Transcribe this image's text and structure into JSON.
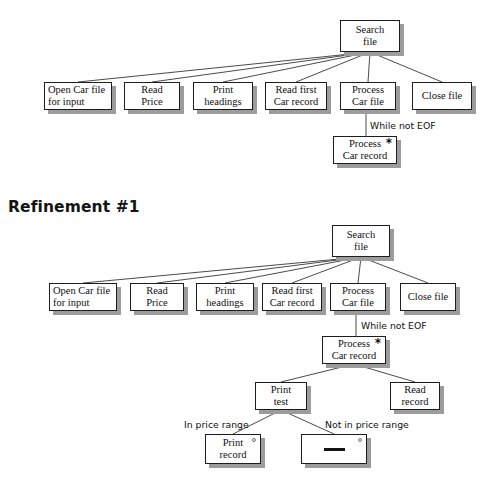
{
  "page": {
    "background": "#ffffff",
    "box_fill": "#ffffff",
    "box_border": "#1d1d1d",
    "shadow_color": "#9c9c9c",
    "line_color": "#2a2a2a"
  },
  "headings": [
    {
      "text": "Refinement #1",
      "x": 8,
      "y": 198
    }
  ],
  "diagram_top": {
    "name": "initial-structure-chart",
    "root": {
      "label_lines": [
        "Search",
        "file"
      ],
      "x": 340,
      "y": 20,
      "w": 60,
      "h": 32
    },
    "children": [
      {
        "label_lines": [
          "Open Car file",
          "for input"
        ],
        "x": 44,
        "y": 82,
        "w": 68,
        "h": 28,
        "align": "left"
      },
      {
        "label_lines": [
          "Read",
          "Price"
        ],
        "x": 124,
        "y": 82,
        "w": 56,
        "h": 28,
        "align": "center"
      },
      {
        "label_lines": [
          "Print",
          "headings"
        ],
        "x": 193,
        "y": 82,
        "w": 60,
        "h": 28,
        "align": "center"
      },
      {
        "label_lines": [
          "Read first",
          "Car record"
        ],
        "x": 265,
        "y": 82,
        "w": 62,
        "h": 28,
        "align": "center"
      },
      {
        "label_lines": [
          "Process",
          "Car file"
        ],
        "x": 340,
        "y": 82,
        "w": 56,
        "h": 28,
        "align": "center"
      },
      {
        "label_lines": [
          "Close file"
        ],
        "x": 412,
        "y": 82,
        "w": 60,
        "h": 28,
        "align": "center"
      }
    ],
    "loop_label": {
      "text": "While not EOF",
      "x": 370,
      "y": 120
    },
    "iteration_node": {
      "label_lines": [
        "Process",
        "Car record"
      ],
      "x": 333,
      "y": 136,
      "w": 64,
      "h": 28,
      "iteration_mark": "*"
    }
  },
  "diagram_bottom": {
    "name": "refinement-1-structure-chart",
    "root": {
      "label_lines": [
        "Search",
        "file"
      ],
      "x": 332,
      "y": 225,
      "w": 58,
      "h": 32
    },
    "children": [
      {
        "label_lines": [
          "Open Car file",
          "for input"
        ],
        "x": 49,
        "y": 283,
        "w": 68,
        "h": 28,
        "align": "left"
      },
      {
        "label_lines": [
          "Read",
          "Price"
        ],
        "x": 130,
        "y": 283,
        "w": 54,
        "h": 28,
        "align": "center"
      },
      {
        "label_lines": [
          "Print",
          "headings"
        ],
        "x": 196,
        "y": 283,
        "w": 58,
        "h": 28,
        "align": "center"
      },
      {
        "label_lines": [
          "Read first",
          "Car record"
        ],
        "x": 262,
        "y": 283,
        "w": 60,
        "h": 28,
        "align": "center"
      },
      {
        "label_lines": [
          "Process",
          "Car file"
        ],
        "x": 330,
        "y": 283,
        "w": 56,
        "h": 28,
        "align": "center"
      },
      {
        "label_lines": [
          "Close file"
        ],
        "x": 400,
        "y": 283,
        "w": 56,
        "h": 28,
        "align": "center"
      }
    ],
    "loop_label": {
      "text": "While not EOF",
      "x": 361,
      "y": 320
    },
    "iteration_node": {
      "label_lines": [
        "Process",
        "Car record"
      ],
      "x": 322,
      "y": 336,
      "w": 64,
      "h": 28,
      "iteration_mark": "*"
    },
    "second_level": [
      {
        "label_lines": [
          "Print",
          "test"
        ],
        "x": 255,
        "y": 382,
        "w": 52,
        "h": 28,
        "align": "center"
      },
      {
        "label_lines": [
          "Read",
          "record"
        ],
        "x": 390,
        "y": 382,
        "w": 50,
        "h": 28,
        "align": "center"
      }
    ],
    "condition_labels": [
      {
        "text": "In price range",
        "x": 184,
        "y": 419
      },
      {
        "text": "Not in price range",
        "x": 325,
        "y": 419
      }
    ],
    "selection_nodes": [
      {
        "label_lines": [
          "Print",
          "record"
        ],
        "x": 205,
        "y": 434,
        "w": 56,
        "h": 30,
        "selection_mark": "o",
        "is_null": false
      },
      {
        "label_lines": [],
        "x": 301,
        "y": 434,
        "w": 66,
        "h": 30,
        "selection_mark": "o",
        "is_null": true
      }
    ]
  }
}
